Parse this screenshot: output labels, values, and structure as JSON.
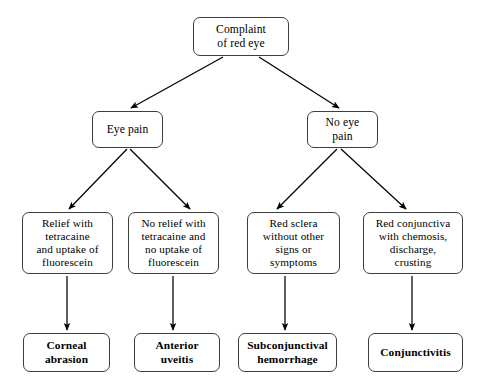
{
  "diagram": {
    "colors": {
      "background": "#ffffff",
      "node_border": "#3d3d3d",
      "node_fill": "#ffffff",
      "text": "#000000",
      "arrow": "#000000"
    },
    "nodes": {
      "root": {
        "label": "Complaint\nof  red eye",
        "x": 193,
        "y": 17,
        "w": 96,
        "h": 39
      },
      "eye_pain": {
        "label": "Eye pain",
        "x": 92,
        "y": 111,
        "w": 71,
        "h": 37
      },
      "no_eye_pain": {
        "label": "No eye\npain",
        "x": 307,
        "y": 111,
        "w": 71,
        "h": 37
      },
      "relief_tetracaine": {
        "label": "Relief with\ntetracaine\nand uptake of\nfluorescein",
        "x": 22,
        "y": 212,
        "w": 91,
        "h": 62
      },
      "no_relief_tetracaine": {
        "label": "No relief with\ntetracaine and\nno uptake of\nfluorescein",
        "x": 128,
        "y": 212,
        "w": 91,
        "h": 62
      },
      "red_sclera": {
        "label": "Red sclera\nwithout other\nsigns or\nsymptoms",
        "x": 247,
        "y": 212,
        "w": 93,
        "h": 62
      },
      "red_conjunctiva": {
        "label": "Red conjunctiva\nwith chemosis,\ndischarge,\ncrusting",
        "x": 363,
        "y": 212,
        "w": 100,
        "h": 62
      },
      "corneal_abrasion": {
        "label": "Corneal\nabrasion",
        "x": 23,
        "y": 333,
        "w": 87,
        "h": 39
      },
      "anterior_uveitis": {
        "label": "Anterior\nuveitis",
        "x": 134,
        "y": 333,
        "w": 86,
        "h": 39
      },
      "subconjunctival_hemorrhage": {
        "label": "Subconjunctival\nhemorrhage",
        "x": 238,
        "y": 333,
        "w": 99,
        "h": 39
      },
      "conjunctivitis": {
        "label": "Conjunctivitis",
        "x": 368,
        "y": 333,
        "w": 95,
        "h": 39
      }
    },
    "edges": [
      {
        "name": "root-to-eye-pain",
        "from": "root",
        "to": "eye_pain",
        "x1": 223,
        "y1": 57,
        "x2": 131,
        "y2": 108
      },
      {
        "name": "root-to-no-eye-pain",
        "from": "root",
        "to": "no_eye_pain",
        "x1": 259,
        "y1": 57,
        "x2": 339,
        "y2": 108
      },
      {
        "name": "eye-pain-to-relief",
        "from": "eye_pain",
        "to": "relief_tetracaine",
        "x1": 127,
        "y1": 149,
        "x2": 69,
        "y2": 209
      },
      {
        "name": "eye-pain-to-no-relief",
        "from": "eye_pain",
        "to": "no_relief_tetracaine",
        "x1": 130,
        "y1": 149,
        "x2": 190,
        "y2": 209
      },
      {
        "name": "no-eye-pain-to-red-sclera",
        "from": "no_eye_pain",
        "to": "red_sclera",
        "x1": 337,
        "y1": 149,
        "x2": 277,
        "y2": 209
      },
      {
        "name": "no-eye-pain-to-red-conj",
        "from": "no_eye_pain",
        "to": "red_conjunctiva",
        "x1": 341,
        "y1": 149,
        "x2": 406,
        "y2": 209
      },
      {
        "name": "relief-to-corneal-abrasion",
        "from": "relief_tetracaine",
        "to": "corneal_abrasion",
        "x1": 67,
        "y1": 276,
        "x2": 67,
        "y2": 330
      },
      {
        "name": "no-relief-to-uveitis",
        "from": "no_relief_tetracaine",
        "to": "anterior_uveitis",
        "x1": 173,
        "y1": 276,
        "x2": 173,
        "y2": 330
      },
      {
        "name": "red-sclera-to-hemorrhage",
        "from": "red_sclera",
        "to": "subconjunctival_hemorrhage",
        "x1": 285,
        "y1": 276,
        "x2": 285,
        "y2": 330
      },
      {
        "name": "red-conj-to-conjunctivitis",
        "from": "red_conjunctiva",
        "to": "conjunctivitis",
        "x1": 412,
        "y1": 276,
        "x2": 412,
        "y2": 330
      }
    ]
  }
}
